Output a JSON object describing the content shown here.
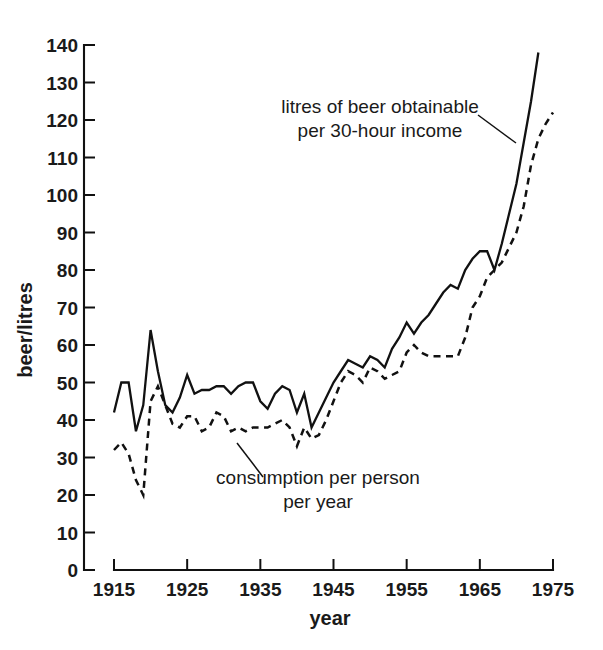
{
  "chart_data": {
    "type": "line",
    "title": "",
    "xlabel": "year",
    "ylabel": "beer/litres",
    "xlim": [
      1915,
      1975
    ],
    "ylim": [
      0,
      140
    ],
    "grid": false,
    "legend_position": "inline-annotations",
    "xticks": [
      "1915",
      "1925",
      "1935",
      "1945",
      "1955",
      "1965",
      "1975"
    ],
    "xtick_values": [
      1915,
      1925,
      1935,
      1945,
      1955,
      1965,
      1975
    ],
    "yticks": [
      "0",
      "10",
      "20",
      "30",
      "40",
      "50",
      "60",
      "70",
      "80",
      "90",
      "100",
      "110",
      "120",
      "130",
      "140"
    ],
    "ytick_values": [
      0,
      10,
      20,
      30,
      40,
      50,
      60,
      70,
      80,
      90,
      100,
      110,
      120,
      130,
      140
    ],
    "annotations": [
      {
        "name": "solid-series-annotation",
        "lines": [
          "litres of beer obtainable",
          "per 30-hour income"
        ],
        "text_x": 380,
        "text_y": 113,
        "leader": [
          [
            478,
            115
          ],
          [
            516,
            143
          ]
        ]
      },
      {
        "name": "dashed-series-annotation",
        "lines": [
          "consumption per person",
          "per year"
        ],
        "text_x": 318,
        "text_y": 484,
        "leader": [
          [
            237,
            443
          ],
          [
            263,
            477
          ]
        ]
      }
    ],
    "series": [
      {
        "name": "litres of beer obtainable per 30-hour income",
        "style": "solid",
        "x": [
          1915,
          1916,
          1917,
          1918,
          1919,
          1920,
          1921,
          1922,
          1923,
          1924,
          1925,
          1926,
          1927,
          1928,
          1929,
          1930,
          1931,
          1932,
          1933,
          1934,
          1935,
          1936,
          1937,
          1938,
          1939,
          1940,
          1941,
          1942,
          1943,
          1944,
          1945,
          1946,
          1947,
          1948,
          1949,
          1950,
          1951,
          1952,
          1953,
          1954,
          1955,
          1956,
          1957,
          1958,
          1959,
          1960,
          1961,
          1962,
          1963,
          1964,
          1965,
          1966,
          1967,
          1968,
          1969,
          1970,
          1971,
          1972,
          1973
        ],
        "values": [
          42,
          50,
          50,
          37,
          44,
          64,
          53,
          44,
          42,
          46,
          52,
          47,
          48,
          48,
          49,
          49,
          47,
          49,
          50,
          50,
          45,
          43,
          47,
          49,
          48,
          42,
          47,
          38,
          42,
          46,
          50,
          53,
          56,
          55,
          54,
          57,
          56,
          54,
          59,
          62,
          66,
          63,
          66,
          68,
          71,
          74,
          76,
          75,
          80,
          83,
          85,
          85,
          80,
          87,
          95,
          103,
          114,
          125,
          138
        ]
      },
      {
        "name": "consumption per person per year",
        "style": "dashed",
        "x": [
          1915,
          1916,
          1917,
          1918,
          1919,
          1920,
          1921,
          1922,
          1923,
          1924,
          1925,
          1926,
          1927,
          1928,
          1929,
          1930,
          1931,
          1932,
          1933,
          1934,
          1935,
          1936,
          1937,
          1938,
          1939,
          1940,
          1941,
          1942,
          1943,
          1944,
          1945,
          1946,
          1947,
          1948,
          1949,
          1950,
          1951,
          1952,
          1953,
          1954,
          1955,
          1956,
          1957,
          1958,
          1959,
          1960,
          1961,
          1962,
          1963,
          1964,
          1965,
          1966,
          1967,
          1968,
          1969,
          1970,
          1971,
          1972,
          1973,
          1974,
          1975
        ],
        "values": [
          32,
          34,
          31,
          24,
          20,
          45,
          49,
          44,
          39,
          38,
          41,
          41,
          37,
          38,
          42,
          41,
          37,
          38,
          37,
          38,
          38,
          38,
          39,
          40,
          38,
          33,
          38,
          35,
          36,
          40,
          45,
          50,
          53,
          52,
          50,
          54,
          53,
          51,
          52,
          53,
          58,
          60,
          58,
          57,
          57,
          57,
          57,
          57,
          62,
          70,
          73,
          78,
          80,
          82,
          86,
          90,
          97,
          108,
          115,
          119,
          122
        ]
      }
    ]
  },
  "axes": {
    "y_title": "beer/litres",
    "x_title": "year"
  }
}
